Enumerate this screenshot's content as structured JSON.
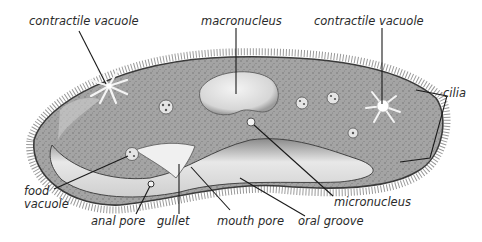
{
  "diagram": {
    "labels": {
      "contractile_vacuole_left": "contractile vacuole",
      "macronucleus": "macronucleus",
      "contractile_vacuole_right": "contractile vacuole",
      "cilia": "cilia",
      "food_vacuole_line1": "food",
      "food_vacuole_line2": "vacuole",
      "anal_pore": "anal pore",
      "gullet": "gullet",
      "mouth_pore": "mouth pore",
      "oral_groove": "oral groove",
      "micronucleus": "micronucleus"
    },
    "colors": {
      "body_fill": "#9a9a9a",
      "body_dark": "#5a5a5a",
      "groove_fill": "#e2e2e2",
      "nucleus_fill": "#e6e6e6",
      "line": "#1a1a1a",
      "text": "#2a2a2a",
      "background": "#ffffff"
    }
  }
}
